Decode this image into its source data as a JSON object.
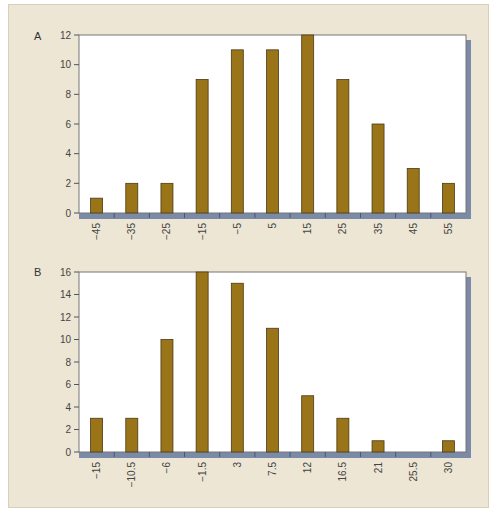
{
  "colors": {
    "panel_bg": "#ede6d4",
    "plot_bg": "#ffffff",
    "bar_fill": "#9a7418",
    "bar_stroke": "#4a3a14",
    "axis_shadow": "#7b8aa6",
    "frame": "#777777"
  },
  "chart_data": [
    {
      "type": "bar",
      "panel_label": "A",
      "title": "",
      "xlabel": "",
      "ylabel": "",
      "categories": [
        "−45",
        "−35",
        "−25",
        "−15",
        "−5",
        "5",
        "15",
        "25",
        "35",
        "45",
        "55"
      ],
      "values": [
        1,
        2,
        2,
        9,
        11,
        11,
        12,
        9,
        6,
        3,
        2
      ],
      "ylim": [
        0,
        12
      ],
      "yticks": [
        0,
        2,
        4,
        6,
        8,
        10,
        12
      ],
      "grid": false,
      "legend": null
    },
    {
      "type": "bar",
      "panel_label": "B",
      "title": "",
      "xlabel": "",
      "ylabel": "",
      "categories": [
        "−15",
        "−10.5",
        "−6",
        "−1.5",
        "3",
        "7.5",
        "12",
        "16.5",
        "21",
        "25.5",
        "30"
      ],
      "values": [
        3,
        3,
        10,
        16,
        15,
        11,
        5,
        3,
        1,
        0,
        1
      ],
      "ylim": [
        0,
        16
      ],
      "yticks": [
        0,
        2,
        4,
        6,
        8,
        10,
        12,
        14,
        16
      ],
      "grid": false,
      "legend": null
    }
  ],
  "layout": [
    {
      "left": 79,
      "right": 466,
      "top": 35,
      "bottom": 213,
      "label_x": 34,
      "label_y": 40
    },
    {
      "left": 79,
      "right": 466,
      "top": 272,
      "bottom": 452,
      "label_x": 34,
      "label_y": 276
    }
  ]
}
